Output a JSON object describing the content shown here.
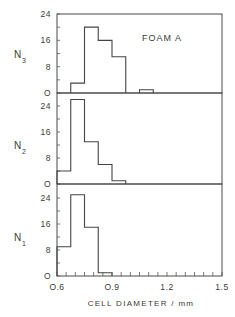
{
  "chart_data": {
    "type": "bar",
    "subtype": "stacked-panel histogram",
    "title": "",
    "annotation": "FOAM A",
    "xlabel": "CELL DIAMETER / mm",
    "xlim": [
      0.6,
      1.5
    ],
    "xticks": [
      "0.6",
      "0.9",
      "1.2",
      "1.5"
    ],
    "x_minor_tick_step": 0.05,
    "bin_width": 0.075,
    "grid": false,
    "legend": null,
    "panels": [
      {
        "name": "N3",
        "ylabel_main": "N",
        "ylabel_sub": "3",
        "ylim": [
          0,
          24
        ],
        "yticks": [
          "0",
          "8",
          "16",
          "24"
        ],
        "bins": [
          {
            "x0": 0.675,
            "x1": 0.75,
            "value": 3
          },
          {
            "x0": 0.75,
            "x1": 0.825,
            "value": 20
          },
          {
            "x0": 0.825,
            "x1": 0.9,
            "value": 16
          },
          {
            "x0": 0.9,
            "x1": 0.975,
            "value": 11
          },
          {
            "x0": 1.05,
            "x1": 1.125,
            "value": 1
          }
        ]
      },
      {
        "name": "N2",
        "ylabel_main": "N",
        "ylabel_sub": "2",
        "ylim": [
          0,
          24
        ],
        "yticks": [
          "0",
          "8",
          "16",
          "24"
        ],
        "bins": [
          {
            "x0": 0.6,
            "x1": 0.675,
            "value": 4
          },
          {
            "x0": 0.675,
            "x1": 0.75,
            "value": 26
          },
          {
            "x0": 0.75,
            "x1": 0.825,
            "value": 13
          },
          {
            "x0": 0.825,
            "x1": 0.9,
            "value": 6
          },
          {
            "x0": 0.9,
            "x1": 0.975,
            "value": 1
          }
        ]
      },
      {
        "name": "N1",
        "ylabel_main": "N",
        "ylabel_sub": "1",
        "ylim": [
          0,
          24
        ],
        "yticks": [
          "0",
          "8",
          "16",
          "24"
        ],
        "bins": [
          {
            "x0": 0.6,
            "x1": 0.675,
            "value": 9
          },
          {
            "x0": 0.675,
            "x1": 0.75,
            "value": 25
          },
          {
            "x0": 0.75,
            "x1": 0.825,
            "value": 15
          },
          {
            "x0": 0.825,
            "x1": 0.9,
            "value": 1
          }
        ]
      }
    ]
  },
  "colors": {
    "ink": "#3a3a3a",
    "background": "#ffffff"
  }
}
